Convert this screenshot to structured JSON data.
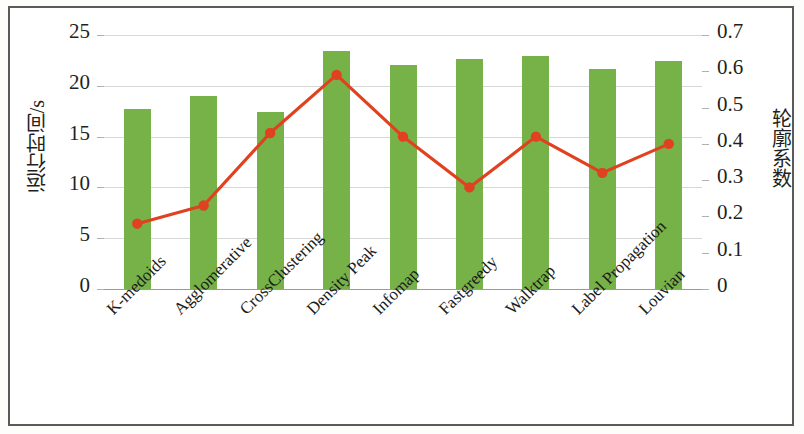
{
  "chart_data": {
    "type": "bar",
    "title": "",
    "categories": [
      "K-medoids",
      "Agglomerative",
      "CrossClustering",
      "Density Peak",
      "Infomap",
      "Fastgreedy",
      "Walktrap",
      "Label Propagation",
      "Louvian"
    ],
    "series": [
      {
        "name": "运行时间/s",
        "type": "bar",
        "axis": "left",
        "color": "#76b248",
        "values": [
          17.7,
          19.0,
          17.4,
          23.4,
          22.0,
          22.6,
          22.9,
          21.7,
          22.4
        ]
      },
      {
        "name": "轮廓系数",
        "type": "line",
        "axis": "right",
        "color": "#e0411f",
        "values": [
          0.18,
          0.23,
          0.43,
          0.59,
          0.42,
          0.28,
          0.42,
          0.32,
          0.4
        ]
      }
    ],
    "xlabel": "",
    "ylabel": "运行时间/s",
    "y2label": "轮廓系数",
    "ylim": [
      0,
      25
    ],
    "y2lim": [
      0,
      0.7
    ],
    "yticks": [
      "0",
      "5",
      "10",
      "15",
      "20",
      "25"
    ],
    "ytick_values": [
      0,
      5,
      10,
      15,
      20,
      25
    ],
    "y2ticks": [
      "0",
      "0.1",
      "0.2",
      "0.3",
      "0.4",
      "0.5",
      "0.6",
      "0.7"
    ],
    "y2tick_values": [
      0,
      0.1,
      0.2,
      0.3,
      0.4,
      0.5,
      0.6,
      0.7
    ],
    "grid": true,
    "legend": "none",
    "bar_color": "#76b248",
    "line_color": "#e0411f",
    "marker_color": "#e0411f",
    "gridline_color": "#d7d7d7"
  }
}
